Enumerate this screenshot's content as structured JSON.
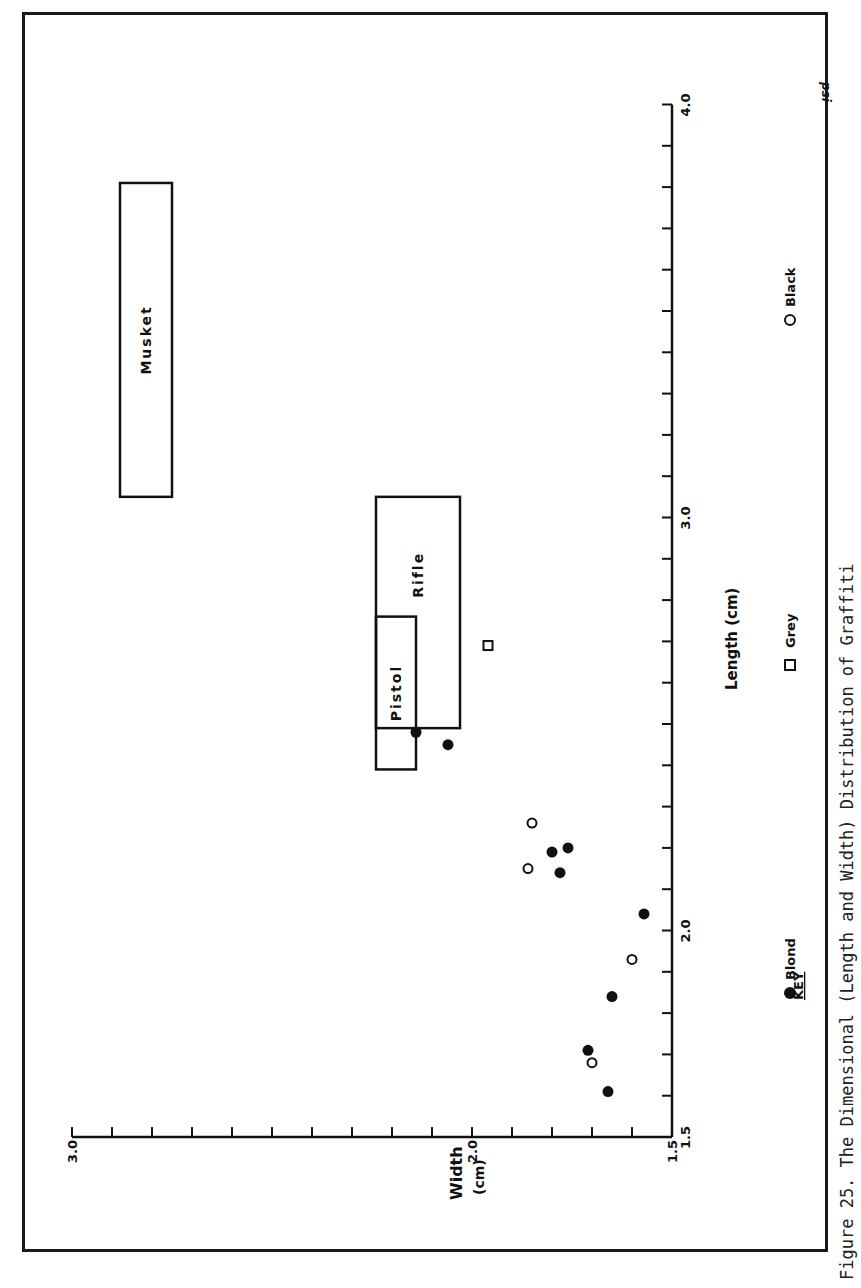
{
  "caption": "Figure 25.  The Dimensional (Length and Width) Distribution of Graffiti",
  "signature": "psi",
  "key": {
    "title": "KEY",
    "items": [
      {
        "label": "Blond",
        "marker": "filled-circle"
      },
      {
        "label": "Grey",
        "marker": "open-square"
      },
      {
        "label": "Black",
        "marker": "open-circle"
      }
    ]
  },
  "axes": {
    "length_label": "Length (cm)",
    "width_label_line1": "Width",
    "width_label_line2": "(cm)",
    "length_ticks": [
      "1.5",
      "2.0",
      "3.0",
      "4.0"
    ],
    "width_ticks": [
      "1.5",
      "2.0",
      "3.0"
    ]
  },
  "regions": [
    {
      "label": "Musket"
    },
    {
      "label": "Rifle"
    },
    {
      "label": "Pistol"
    }
  ],
  "chart_data": {
    "type": "scatter",
    "title": "The Dimensional (Length and Width) Distribution of Graffiti",
    "orientation": "rotated 90deg counter-clockwise (Length axis vertical on right, Width axis horizontal at bottom, increasing leftward)",
    "xlabel": "Length (cm)",
    "ylabel": "Width (cm)",
    "xlim": [
      1.5,
      4.0
    ],
    "ylim": [
      1.5,
      3.0
    ],
    "x_major_ticks": [
      1.5,
      2.0,
      3.0,
      4.0
    ],
    "x_minor_tick_step": 0.1,
    "y_major_ticks": [
      1.5,
      2.0,
      3.0
    ],
    "y_minor_tick_step": 0.1,
    "grid": false,
    "legend": {
      "title": "KEY",
      "position": "bottom-right (rotated)",
      "entries": [
        "Blond",
        "Grey",
        "Black"
      ]
    },
    "series": [
      {
        "name": "Blond",
        "marker": "filled circle",
        "points": [
          {
            "length": 1.61,
            "width": 1.66
          },
          {
            "length": 1.71,
            "width": 1.71
          },
          {
            "length": 1.84,
            "width": 1.65
          },
          {
            "length": 2.04,
            "width": 1.57
          },
          {
            "length": 2.14,
            "width": 1.78
          },
          {
            "length": 2.19,
            "width": 1.8
          },
          {
            "length": 2.2,
            "width": 1.76
          },
          {
            "length": 2.45,
            "width": 2.06
          },
          {
            "length": 2.48,
            "width": 2.14
          }
        ]
      },
      {
        "name": "Grey",
        "marker": "open square",
        "points": [
          {
            "length": 2.69,
            "width": 1.96
          }
        ]
      },
      {
        "name": "Black",
        "marker": "open circle",
        "points": [
          {
            "length": 1.68,
            "width": 1.7
          },
          {
            "length": 1.93,
            "width": 1.6
          },
          {
            "length": 2.15,
            "width": 1.86
          },
          {
            "length": 2.26,
            "width": 1.85
          }
        ]
      }
    ],
    "reference_boxes": [
      {
        "name": "Musket",
        "length_range": [
          3.05,
          3.81
        ],
        "width_range": [
          2.75,
          2.88
        ]
      },
      {
        "name": "Rifle",
        "length_range": [
          2.49,
          3.05
        ],
        "width_range": [
          2.03,
          2.24
        ]
      },
      {
        "name": "Pistol",
        "length_range": [
          2.39,
          2.76
        ],
        "width_range": [
          2.14,
          2.24
        ]
      }
    ]
  }
}
